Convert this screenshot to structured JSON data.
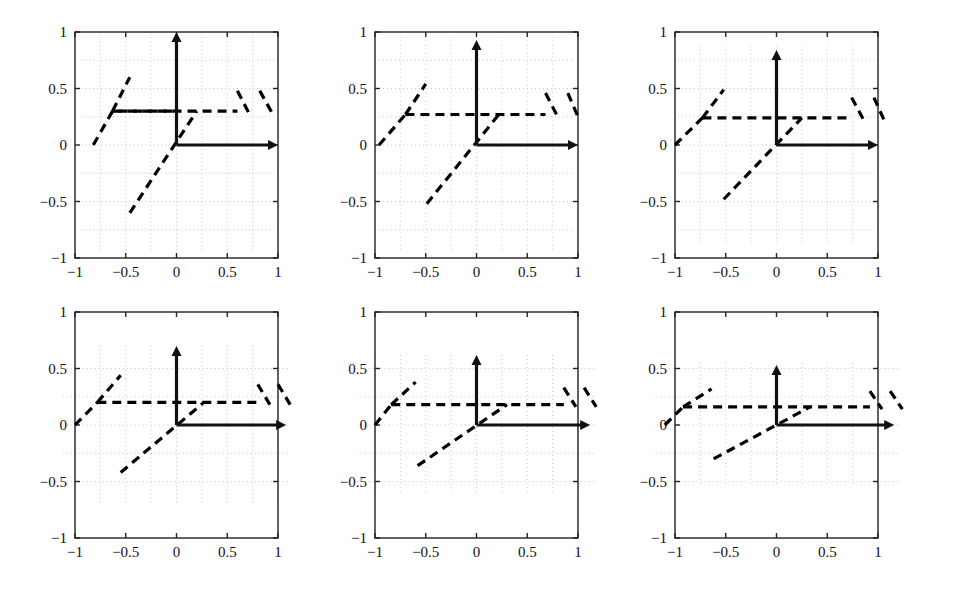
{
  "figure": {
    "title": "",
    "width": 975,
    "height": 601,
    "background": "#ffffff",
    "rows": 2,
    "cols": 3,
    "panel_count": 6
  },
  "style": {
    "axis_color": "#111111",
    "frame_color": "#222222",
    "grid_color": "#b9b9b9",
    "curve_color": "#000000",
    "curve_dash": "9,6",
    "grid_dash": "1,3",
    "axis_width": 3.2,
    "frame_width": 1.4,
    "curve_width": 3.2,
    "grid_width": 0.8
  },
  "axes": {
    "xlabel": "",
    "ylabel": "",
    "xlim": [
      -1,
      1
    ],
    "ylim": [
      -1,
      1
    ],
    "xticks": [
      -1,
      -0.5,
      0,
      0.5,
      1
    ],
    "yticks": [
      -1,
      -0.5,
      0,
      0.5,
      1
    ],
    "xtick_labels": [
      "−1",
      "−0.5",
      "0",
      "0.5",
      "1"
    ],
    "ytick_labels": [
      "−1",
      "−0.5",
      "0",
      "0.5",
      "1"
    ],
    "minor_grid_step": 0.25,
    "grid": "on"
  },
  "chart_data": {
    "type": "line",
    "title": "",
    "xlabel": "",
    "ylabel": "",
    "xlim": [
      -1,
      1
    ],
    "ylim": [
      -1,
      1
    ],
    "grid": "on",
    "legend": "none",
    "panels": [
      {
        "index": 1,
        "row": 1,
        "col": 1,
        "plateau_level": 0.3,
        "vertical_arrow_tip": 1.0,
        "horizontal_arrow_tip": 1.0,
        "grid_rect": [
          -0.94,
          -0.95,
          0.97,
          0.99
        ],
        "series": [
          {
            "name": "ramp-left",
            "type": "line",
            "style": "dashed",
            "x": [
              -0.82,
              -0.63,
              -0.63,
              0.0
            ],
            "y": [
              0.0,
              0.3,
              0.3,
              0.3
            ]
          },
          {
            "name": "ramp-left-rise",
            "type": "line",
            "style": "dashed",
            "x": [
              -0.63,
              -0.46
            ],
            "y": [
              0.3,
              0.6
            ]
          },
          {
            "name": "plateau",
            "type": "line",
            "style": "dashed",
            "x": [
              -0.63,
              0.6
            ],
            "y": [
              0.3,
              0.3
            ]
          },
          {
            "name": "ramp-center",
            "type": "line",
            "style": "dashed",
            "x": [
              -0.46,
              0.2
            ],
            "y": [
              -0.6,
              0.3
            ]
          },
          {
            "name": "falling-1",
            "type": "line",
            "style": "dashed",
            "x": [
              0.6,
              0.72
            ],
            "y": [
              0.48,
              0.27
            ]
          },
          {
            "name": "falling-2",
            "type": "line",
            "style": "dashed",
            "x": [
              0.82,
              0.95
            ],
            "y": [
              0.48,
              0.27
            ]
          }
        ]
      },
      {
        "index": 2,
        "row": 1,
        "col": 2,
        "plateau_level": 0.27,
        "vertical_arrow_tip": 0.93,
        "horizontal_arrow_tip": 1.0,
        "grid_rect": [
          -0.96,
          -0.95,
          0.97,
          0.96
        ],
        "series": [
          {
            "name": "ramp-left",
            "type": "line",
            "style": "dashed",
            "x": [
              -0.96,
              -0.7
            ],
            "y": [
              0.0,
              0.27
            ]
          },
          {
            "name": "ramp-left-rise",
            "type": "line",
            "style": "dashed",
            "x": [
              -0.7,
              -0.5
            ],
            "y": [
              0.27,
              0.54
            ]
          },
          {
            "name": "plateau",
            "type": "line",
            "style": "dashed",
            "x": [
              -0.7,
              0.68
            ],
            "y": [
              0.27,
              0.27
            ]
          },
          {
            "name": "ramp-center",
            "type": "line",
            "style": "dashed",
            "x": [
              -0.49,
              0.22
            ],
            "y": [
              -0.52,
              0.27
            ]
          },
          {
            "name": "falling-1",
            "type": "line",
            "style": "dashed",
            "x": [
              0.68,
              0.8
            ],
            "y": [
              0.46,
              0.25
            ]
          },
          {
            "name": "falling-2",
            "type": "line",
            "style": "dashed",
            "x": [
              0.9,
              1.0
            ],
            "y": [
              0.46,
              0.25
            ]
          }
        ]
      },
      {
        "index": 3,
        "row": 1,
        "col": 3,
        "plateau_level": 0.24,
        "vertical_arrow_tip": 0.84,
        "horizontal_arrow_tip": 1.0,
        "grid_rect": [
          -0.97,
          -0.88,
          0.97,
          0.88
        ],
        "series": [
          {
            "name": "ramp-left",
            "type": "line",
            "style": "dashed",
            "x": [
              -1.0,
              -0.73
            ],
            "y": [
              0.0,
              0.24
            ]
          },
          {
            "name": "ramp-left-rise",
            "type": "line",
            "style": "dashed",
            "x": [
              -0.73,
              -0.52
            ],
            "y": [
              0.24,
              0.49
            ]
          },
          {
            "name": "plateau",
            "type": "line",
            "style": "dashed",
            "x": [
              -0.73,
              0.74
            ],
            "y": [
              0.24,
              0.24
            ]
          },
          {
            "name": "ramp-center",
            "type": "line",
            "style": "dashed",
            "x": [
              -0.52,
              0.25
            ],
            "y": [
              -0.48,
              0.24
            ]
          },
          {
            "name": "falling-1",
            "type": "line",
            "style": "dashed",
            "x": [
              0.74,
              0.86
            ],
            "y": [
              0.42,
              0.22
            ]
          },
          {
            "name": "falling-2",
            "type": "line",
            "style": "dashed",
            "x": [
              0.96,
              1.06
            ],
            "y": [
              0.42,
              0.22
            ]
          }
        ]
      },
      {
        "index": 4,
        "row": 2,
        "col": 1,
        "plateau_level": 0.2,
        "vertical_arrow_tip": 0.7,
        "horizontal_arrow_tip": 1.08,
        "grid_rect": [
          -1.12,
          -0.7,
          1.12,
          0.7
        ],
        "series": [
          {
            "name": "ramp-left",
            "type": "line",
            "style": "dashed",
            "x": [
              -1.0,
              -0.78
            ],
            "y": [
              0.0,
              0.2
            ]
          },
          {
            "name": "ramp-left-rise",
            "type": "line",
            "style": "dashed",
            "x": [
              -0.78,
              -0.55
            ],
            "y": [
              0.2,
              0.44
            ]
          },
          {
            "name": "plateau",
            "type": "line",
            "style": "dashed",
            "x": [
              -0.78,
              0.8
            ],
            "y": [
              0.2,
              0.2
            ]
          },
          {
            "name": "ramp-center",
            "type": "line",
            "style": "dashed",
            "x": [
              -0.55,
              0.27
            ],
            "y": [
              -0.42,
              0.2
            ]
          },
          {
            "name": "falling-1",
            "type": "line",
            "style": "dashed",
            "x": [
              0.8,
              0.92
            ],
            "y": [
              0.36,
              0.18
            ]
          },
          {
            "name": "falling-2",
            "type": "line",
            "style": "dashed",
            "x": [
              1.0,
              1.12
            ],
            "y": [
              0.36,
              0.18
            ]
          }
        ]
      },
      {
        "index": 5,
        "row": 2,
        "col": 2,
        "plateau_level": 0.18,
        "vertical_arrow_tip": 0.62,
        "horizontal_arrow_tip": 1.12,
        "grid_rect": [
          -1.18,
          -0.62,
          1.18,
          0.62
        ],
        "series": [
          {
            "name": "ramp-left",
            "type": "line",
            "style": "dashed",
            "x": [
              -1.0,
              -0.84
            ],
            "y": [
              0.0,
              0.18
            ]
          },
          {
            "name": "ramp-left-rise",
            "type": "line",
            "style": "dashed",
            "x": [
              -0.84,
              -0.6
            ],
            "y": [
              0.18,
              0.38
            ]
          },
          {
            "name": "plateau",
            "type": "line",
            "style": "dashed",
            "x": [
              -0.84,
              0.86
            ],
            "y": [
              0.18,
              0.18
            ]
          },
          {
            "name": "ramp-center",
            "type": "line",
            "style": "dashed",
            "x": [
              -0.58,
              0.3
            ],
            "y": [
              -0.36,
              0.18
            ]
          },
          {
            "name": "falling-1",
            "type": "line",
            "style": "dashed",
            "x": [
              0.86,
              0.98
            ],
            "y": [
              0.33,
              0.16
            ]
          },
          {
            "name": "falling-2",
            "type": "line",
            "style": "dashed",
            "x": [
              1.06,
              1.18
            ],
            "y": [
              0.33,
              0.16
            ]
          }
        ]
      },
      {
        "index": 6,
        "row": 2,
        "col": 3,
        "plateau_level": 0.16,
        "vertical_arrow_tip": 0.53,
        "horizontal_arrow_tip": 1.16,
        "grid_rect": [
          -1.22,
          -0.55,
          1.22,
          0.55
        ],
        "series": [
          {
            "name": "ramp-left",
            "type": "line",
            "style": "dashed",
            "x": [
              -1.1,
              -0.92
            ],
            "y": [
              0.0,
              0.16
            ]
          },
          {
            "name": "ramp-left-rise",
            "type": "line",
            "style": "dashed",
            "x": [
              -0.92,
              -0.64
            ],
            "y": [
              0.16,
              0.32
            ]
          },
          {
            "name": "plateau",
            "type": "line",
            "style": "dashed",
            "x": [
              -0.92,
              0.92
            ],
            "y": [
              0.16,
              0.16
            ]
          },
          {
            "name": "ramp-center",
            "type": "line",
            "style": "dashed",
            "x": [
              -0.62,
              0.33
            ],
            "y": [
              -0.3,
              0.16
            ]
          },
          {
            "name": "falling-1",
            "type": "line",
            "style": "dashed",
            "x": [
              0.92,
              1.04
            ],
            "y": [
              0.3,
              0.14
            ]
          },
          {
            "name": "falling-2",
            "type": "line",
            "style": "dashed",
            "x": [
              1.12,
              1.24
            ],
            "y": [
              0.3,
              0.14
            ]
          }
        ]
      }
    ]
  }
}
